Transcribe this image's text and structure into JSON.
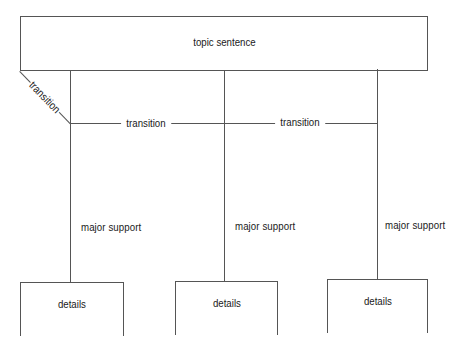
{
  "diagram": {
    "type": "paragraph-structure-tree",
    "topic": {
      "label": "topic sentence"
    },
    "transitions": [
      {
        "label": "transition",
        "position": "diagonal-left"
      },
      {
        "label": "transition",
        "position": "between-support-1-2"
      },
      {
        "label": "transition",
        "position": "between-support-2-3"
      }
    ],
    "supports": [
      {
        "label": "major support",
        "details": {
          "label": "details"
        }
      },
      {
        "label": "major support",
        "details": {
          "label": "details"
        }
      },
      {
        "label": "major support",
        "details": {
          "label": "details"
        }
      }
    ],
    "colors": {
      "line": "#555555",
      "text": "#1a1a1a",
      "background": "#ffffff"
    }
  }
}
